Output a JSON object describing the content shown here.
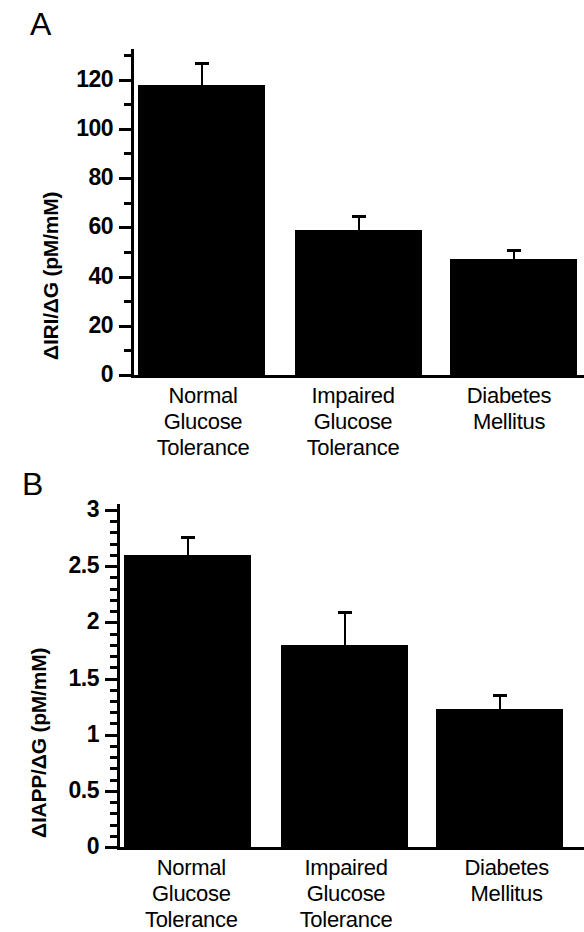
{
  "figure": {
    "panels": [
      {
        "letter": "A",
        "ylabel": "ΔIRI/ΔG  (pM/mM)",
        "yticks": [
          "0",
          "20",
          "40",
          "60",
          "80",
          "100",
          "120"
        ]
      },
      {
        "letter": "B",
        "ylabel": "ΔIAPP/ΔG  (pM/mM)",
        "yticks": [
          "0",
          "0.5",
          "1",
          "1.5",
          "2",
          "2.5",
          "3"
        ]
      }
    ],
    "categories": [
      {
        "line1": "Normal",
        "line2": "Glucose",
        "line3": "Tolerance"
      },
      {
        "line1": "Impaired",
        "line2": "Glucose",
        "line3": "Tolerance"
      },
      {
        "line1": "Diabetes",
        "line2": "Mellitus",
        "line3": ""
      }
    ]
  },
  "chart_data": [
    {
      "type": "bar",
      "panel": "A",
      "title": "",
      "xlabel": "",
      "ylabel": "ΔIRI/ΔG  (pM/mM)",
      "categories": [
        "Normal Glucose Tolerance",
        "Impaired Glucose Tolerance",
        "Diabetes Mellitus"
      ],
      "values": [
        118,
        59,
        47
      ],
      "errors": [
        9,
        6,
        4
      ],
      "ylim": [
        0,
        130
      ],
      "ytick_values": [
        0,
        20,
        40,
        60,
        80,
        100,
        120
      ],
      "yminor_interval": 10,
      "ytick_labels": [
        "0",
        "20",
        "40",
        "60",
        "80",
        "100",
        "120"
      ],
      "grid": false,
      "legend": "none",
      "bar_color": "#000000"
    },
    {
      "type": "bar",
      "panel": "B",
      "title": "",
      "xlabel": "",
      "ylabel": "ΔIAPP/ΔG  (pM/mM)",
      "categories": [
        "Normal Glucose Tolerance",
        "Impaired Glucose Tolerance",
        "Diabetes Mellitus"
      ],
      "values": [
        2.6,
        1.8,
        1.23
      ],
      "errors": [
        0.17,
        0.3,
        0.13
      ],
      "ylim": [
        0,
        3
      ],
      "ytick_values": [
        0,
        0.5,
        1,
        1.5,
        2,
        2.5,
        3
      ],
      "yminor_interval": 0.1,
      "ytick_labels": [
        "0",
        "0.5",
        "1",
        "1.5",
        "2",
        "2.5",
        "3"
      ],
      "grid": false,
      "legend": "none",
      "bar_color": "#000000"
    }
  ]
}
